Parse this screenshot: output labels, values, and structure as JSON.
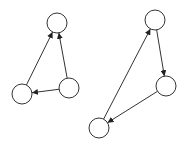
{
  "diagram": {
    "graphs": [
      {
        "name": "left-graph",
        "nodes": [
          {
            "id": "L-top"
          },
          {
            "id": "L-bottom-left"
          },
          {
            "id": "L-bottom-right"
          }
        ],
        "edges": [
          {
            "from": "L-bottom-left",
            "to": "L-top"
          },
          {
            "from": "L-bottom-right",
            "to": "L-top"
          },
          {
            "from": "L-bottom-right",
            "to": "L-bottom-left"
          }
        ]
      },
      {
        "name": "right-graph",
        "nodes": [
          {
            "id": "R-top"
          },
          {
            "id": "R-middle-right"
          },
          {
            "id": "R-bottom-left"
          }
        ],
        "edges": [
          {
            "from": "R-top",
            "to": "R-middle-right"
          },
          {
            "from": "R-middle-right",
            "to": "R-bottom-left"
          },
          {
            "from": "R-bottom-left",
            "to": "R-top"
          }
        ]
      }
    ]
  }
}
